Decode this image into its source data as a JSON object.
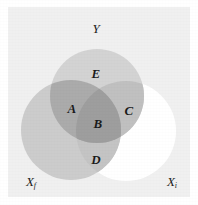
{
  "figure": {
    "background_color": "#ffffff",
    "panel_color": "#f0f0f0",
    "width": 198,
    "height": 205
  },
  "sets": [
    {
      "key": "Y",
      "label": "Y",
      "subscript": "",
      "label_x": 96,
      "label_y": 29,
      "cx": 97,
      "cy": 96,
      "r": 47,
      "fill": "#d3d3d3",
      "filled": true
    },
    {
      "key": "Xf",
      "label": "X",
      "subscript": "f",
      "label_x": 31,
      "label_y": 182,
      "cx": 71,
      "cy": 130,
      "r": 50,
      "fill": "#cccccc",
      "filled": true
    },
    {
      "key": "Xi",
      "label": "X",
      "subscript": "i",
      "label_x": 172,
      "label_y": 182,
      "cx": 126,
      "cy": 131,
      "r": 50,
      "fill": "#ffffff",
      "filled": false
    }
  ],
  "regions": [
    {
      "key": "E",
      "label": "E",
      "x": 96,
      "y": 73,
      "description": "Y only",
      "tone": "#d6d6d6"
    },
    {
      "key": "A",
      "label": "A",
      "x": 72,
      "y": 108,
      "description": "Y and Xf",
      "tone": "#ababab"
    },
    {
      "key": "B",
      "label": "B",
      "x": 98,
      "y": 123,
      "description": "Y, Xf and Xi",
      "tone": "#9e9e9e"
    },
    {
      "key": "C",
      "label": "C",
      "x": 129,
      "y": 110,
      "description": "Y and Xi",
      "tone": "#c0c0c0"
    },
    {
      "key": "D",
      "label": "D",
      "x": 96,
      "y": 159,
      "description": "Xf and Xi",
      "tone": "#c4c4c4"
    }
  ],
  "colors": {
    "panel": "#f0f0f0",
    "y_circle": "#d3d3d3",
    "xf_circle": "#cccccc",
    "xi_circle": "#ffffff",
    "text": "#1a1a1a"
  }
}
